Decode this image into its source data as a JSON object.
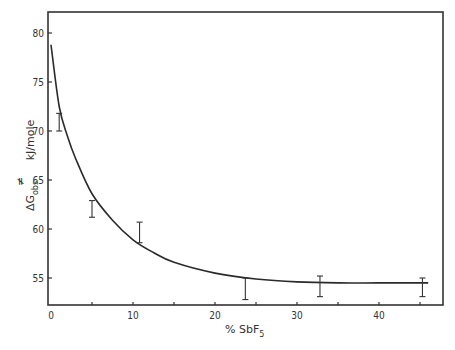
{
  "chart_data": {
    "type": "line",
    "title": "",
    "xlabel": "% SbF5",
    "xlabel_main": "%  SbF",
    "xlabel_sub": "5",
    "ylabel": "ΔG‡obs  kJ/mole",
    "ylabel_delta": "ΔG",
    "ylabel_sup": "≠",
    "ylabel_sub": "obs",
    "ylabel_units": "kJ/mole",
    "xlim": [
      0,
      48
    ],
    "ylim": [
      52.4,
      82
    ],
    "grid": false,
    "legend": null,
    "x_ticks": [
      0,
      10,
      20,
      30,
      40
    ],
    "x_tick_labels": [
      "0",
      "10",
      "20",
      "30",
      "40"
    ],
    "y_ticks": [
      55,
      60,
      65,
      70,
      75,
      80
    ],
    "y_tick_labels": [
      "55",
      "60",
      "65",
      "70",
      "75",
      "80"
    ],
    "series": [
      {
        "name": "fitted curve",
        "x": [
          0,
          1,
          2,
          3,
          5,
          7.5,
          10,
          12.5,
          15,
          20,
          25,
          30,
          35,
          40,
          46
        ],
        "y": [
          78.8,
          72.5,
          69.5,
          67.2,
          63.6,
          60.9,
          58.9,
          57.6,
          56.6,
          55.5,
          54.9,
          54.6,
          54.5,
          54.5,
          54.5
        ]
      },
      {
        "name": "data (error bars)",
        "x": [
          1.0,
          5.0,
          10.8,
          23.7,
          32.8,
          45.3
        ],
        "y_low": [
          70.0,
          61.2,
          58.6,
          52.8,
          53.1,
          53.1
        ],
        "y_high": [
          71.8,
          62.9,
          60.7,
          55.0,
          55.2,
          55.0
        ]
      }
    ]
  }
}
